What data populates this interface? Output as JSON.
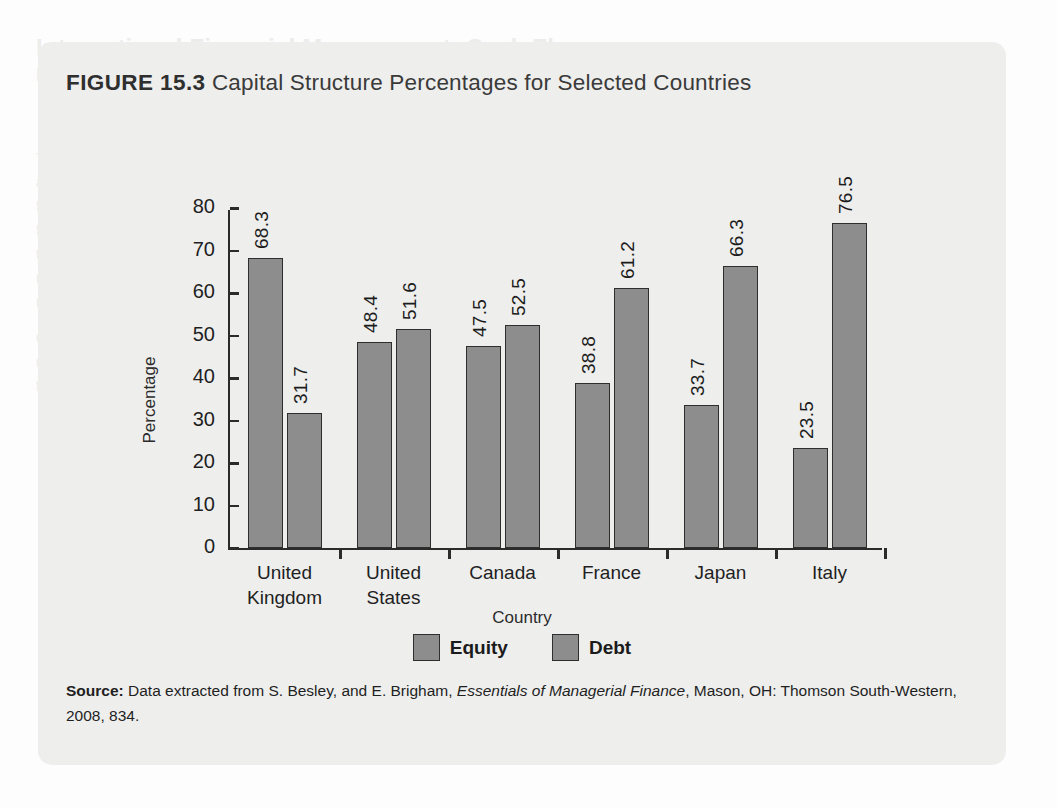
{
  "page": {
    "bleed_text": {
      "heading": "International Financial Management: Cash Flow",
      "subheading": "Management",
      "lines": [
        "The management of cash flows is an important part of international financial man-",
        "agement. One of the essentials of financial management is to ensure that sufficient",
        "funds are available to meet obligations as they arise. In the international arena,",
        "funds may be located in various countries and currencies. The management of",
        "these funds requires consideration of exchange rates, interest rates, and movement",
        "restrictions. Multinational firms must also consider the tax implications of cash",
        "movements across borders and the costs associated with such transfers.",
        "Cash management for the multinational firm is complex because there are",
        "many currencies, accounts, and jurisdictions involved. Managers must be able to",
        "forecast cash needs and determine where surplus funds should be held."
      ],
      "footer_heading": "KEY SUMMARY OF MULTINATIONAL",
      "footer_heading2": "FINANCIAL MANAGEMENT"
    }
  },
  "figure": {
    "number_label": "FIGURE 15.3",
    "title": "Capital Structure Percentages for Selected Countries",
    "source": {
      "label": "Source:",
      "text_before": " Data extracted from S. Besley, and E. Brigham, ",
      "italic": "Essentials of Managerial Finance",
      "text_after": ", Mason, OH: Thomson South-Western, 2008, 834."
    }
  },
  "chart_data": {
    "type": "bar",
    "title": "Capital Structure Percentages for Selected Countries",
    "xlabel": "Country",
    "ylabel": "Percentage",
    "ylim": [
      0,
      80
    ],
    "yticks": [
      0,
      10,
      20,
      30,
      40,
      50,
      60,
      70,
      80
    ],
    "grid": false,
    "legend_position": "bottom-center",
    "bar_color": "#8d8d8d",
    "bar_border_color": "#2e2e2e",
    "categories": [
      "United Kingdom",
      "United States",
      "Canada",
      "France",
      "Japan",
      "Italy"
    ],
    "category_lines": [
      [
        "United",
        "Kingdom"
      ],
      [
        "United",
        "States"
      ],
      [
        "Canada"
      ],
      [
        "France"
      ],
      [
        "Japan"
      ],
      [
        "Italy"
      ]
    ],
    "series": [
      {
        "name": "Equity",
        "values": [
          68.3,
          48.4,
          47.5,
          38.8,
          33.7,
          23.5
        ]
      },
      {
        "name": "Debt",
        "values": [
          31.7,
          51.6,
          52.5,
          61.2,
          66.3,
          76.5
        ]
      }
    ],
    "data_labels": [
      "68.3",
      "31.7",
      "48.4",
      "51.6",
      "47.5",
      "52.5",
      "38.8",
      "61.2",
      "33.7",
      "66.3",
      "23.5",
      "76.5"
    ]
  }
}
